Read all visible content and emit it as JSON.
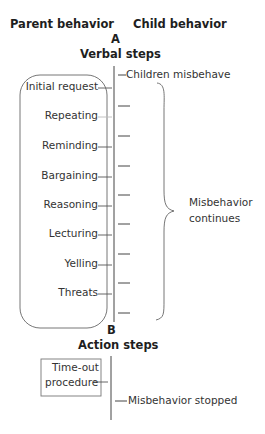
{
  "headers": {
    "parent": "Parent behavior",
    "child": "Child behavior"
  },
  "section_a": {
    "letter": "A",
    "title": "Verbal steps",
    "child_start": "Children misbehave",
    "parent_steps": [
      "Initial request",
      "Repeating",
      "Reminding",
      "Bargaining",
      "Reasoning",
      "Lecturing",
      "Yelling",
      "Threats"
    ],
    "bracket_label_line1": "Misbehavior",
    "bracket_label_line2": "continues"
  },
  "section_b": {
    "letter": "B",
    "title": "Action steps",
    "procedure_line1": "Time-out",
    "procedure_line2": "procedure",
    "child_result": "Misbehavior stopped"
  },
  "colors": {
    "text": "#2a2a2a",
    "lines": "#555555",
    "background": "#ffffff"
  }
}
